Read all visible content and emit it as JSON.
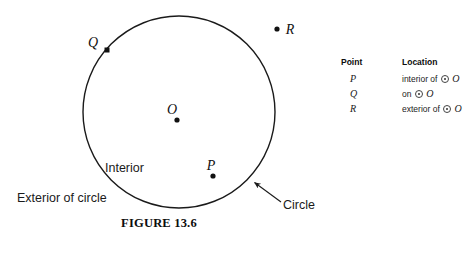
{
  "figure": {
    "caption": "FIGURE 13.6",
    "circle": {
      "center_x": 179,
      "center_y": 112,
      "radius": 96,
      "stroke_color": "#1a1a1a"
    },
    "labels": {
      "interior": "Interior",
      "exterior": "Exterior of circle",
      "circle_callout": "Circle"
    },
    "points": [
      {
        "name": "O",
        "role": "center",
        "x": 177,
        "y": 120,
        "label": "O",
        "label_x": 173,
        "label_y": 114
      },
      {
        "name": "P",
        "role": "interior",
        "x": 213,
        "y": 176,
        "label": "P",
        "label_x": 209,
        "label_y": 169
      },
      {
        "name": "Q",
        "role": "on-circle",
        "x": 107,
        "y": 50,
        "label": "Q",
        "label_x": 91,
        "label_y": 48
      },
      {
        "name": "R",
        "role": "exterior",
        "x": 277,
        "y": 29,
        "label": "R",
        "label_x": 287,
        "label_y": 33
      }
    ]
  },
  "legend": {
    "headers": {
      "point": "Point",
      "location": "Location"
    },
    "rows": [
      {
        "point": "P",
        "prefix": "interior of",
        "circle_symbol": "circle-with-center-dot",
        "center": "O"
      },
      {
        "point": "Q",
        "prefix": "on",
        "circle_symbol": "circle-with-center-dot",
        "center": "O"
      },
      {
        "point": "R",
        "prefix": "exterior of",
        "circle_symbol": "circle-with-center-dot",
        "center": "O"
      }
    ]
  }
}
